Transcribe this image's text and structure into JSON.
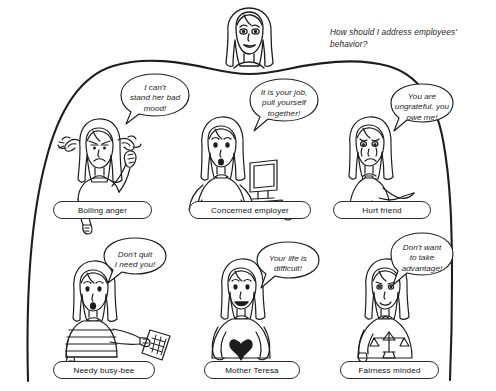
{
  "scene": {
    "type": "hand-drawn-cartoon-diagram",
    "narrator_question": "How should I address employees' behavior?",
    "ink_color": "#1d1d1d",
    "background_color": "#ffffff"
  },
  "narrator": {
    "name": "narrator-head",
    "description": "woman's head with long hair peeking over the thought cloud"
  },
  "cloud": {
    "name": "thought-cloud",
    "description": "large open hand-drawn blob enclosing the six reaction figures"
  },
  "characters": [
    {
      "id": "boiling-anger",
      "label": "Boiling anger",
      "bubble": "I can't\nstand her bad\nmood!",
      "bubble_lines": [
        "I can't",
        "stand her bad",
        "mood!"
      ],
      "figure": "angry-woman-steam-ears-raised-fist"
    },
    {
      "id": "concerned-employer",
      "label": "Concerned employer",
      "bubble": "It is your job,\npull yourself\ntogether!",
      "bubble_lines": [
        "It is your job,",
        "pull yourself",
        "together!"
      ],
      "figure": "woman-hands-on-hips-with-computer"
    },
    {
      "id": "hurt-friend",
      "label": "Hurt friend",
      "bubble": "You are\nungrateful, you\nowe me!",
      "bubble_lines": [
        "You are",
        "ungrateful, you",
        "owe me!"
      ],
      "figure": "crying-woman-pointing-finger"
    },
    {
      "id": "needy-busy-bee",
      "label": "Needy busy-bee",
      "bubble": "Don't quit\nI need you!",
      "bubble_lines": [
        "Don't quit",
        "I need you!"
      ],
      "figure": "woman-striped-shirt-holding-document"
    },
    {
      "id": "mother-teresa",
      "label": "Mother Teresa",
      "bubble": "Your life is\ndifficult!",
      "bubble_lines": [
        "Your life is",
        "difficult!"
      ],
      "figure": "smiling-woman-holding-heart"
    },
    {
      "id": "fairness-minded",
      "label": "Fairness minded",
      "bubble": "Don't want\nto take\nadvantage!",
      "bubble_lines": [
        "Don't want",
        "to take",
        "advantage!"
      ],
      "figure": "woman-holding-balance-scale"
    }
  ]
}
